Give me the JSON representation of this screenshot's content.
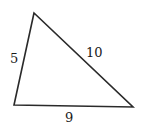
{
  "diagram": {
    "type": "triangle",
    "vertices": {
      "top": [
        34,
        13
      ],
      "bottom_left": [
        14,
        105
      ],
      "bottom_right": [
        133,
        107
      ]
    },
    "sides": [
      {
        "name": "left",
        "label": "5",
        "from": "bottom_left",
        "to": "top"
      },
      {
        "name": "hypotenuse",
        "label": "10",
        "from": "top",
        "to": "bottom_right"
      },
      {
        "name": "base",
        "label": "9",
        "from": "bottom_left",
        "to": "bottom_right"
      }
    ],
    "stroke_color": "#2a2a2a",
    "text_color": "#1a1a1a"
  }
}
